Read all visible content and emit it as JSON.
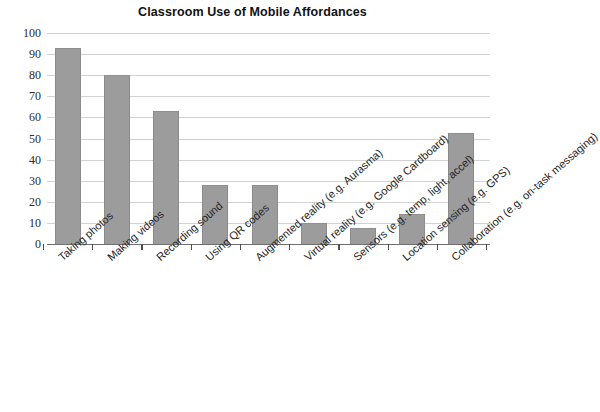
{
  "chart_data": {
    "type": "bar",
    "title": "Classroom Use of Mobile Affordances",
    "xlabel": "",
    "ylabel": "",
    "ylim": [
      0,
      100
    ],
    "ytick_step": 10,
    "yticks": [
      0,
      10,
      20,
      30,
      40,
      50,
      60,
      70,
      80,
      90,
      100
    ],
    "grid": true,
    "legend": false,
    "bar_color": "#9c9c9c",
    "categories": [
      "Taking photos",
      "Making videos",
      "Recording sound",
      "Using QR codes",
      "Augmented reality (e.g. Aurasma)",
      "Virtual reality (e.g. Google Cardboard)",
      "Sensors (e.g. temp, light, accel)",
      "Location sensing (e.g. GPS)",
      "Collaboration (e.g. on-task messaging)"
    ],
    "values": [
      93,
      80,
      63,
      28,
      28,
      10,
      7.5,
      14,
      52.5
    ]
  }
}
